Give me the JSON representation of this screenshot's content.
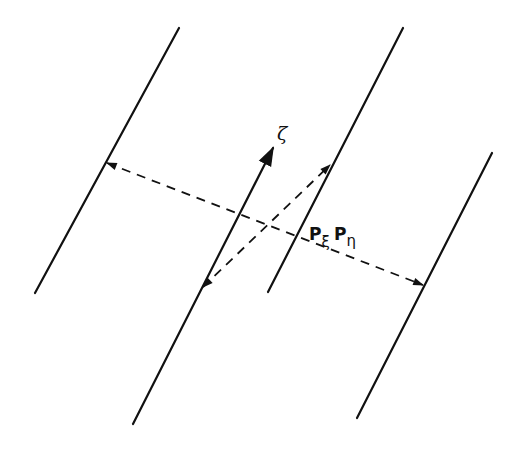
{
  "diagram": {
    "type": "geometric-projection-diagram",
    "background": "#ffffff",
    "stroke_color": "#111111",
    "parallel_lines": [
      {
        "id": "line-left",
        "x1": 179,
        "y1": 28,
        "x2": 35,
        "y2": 293
      },
      {
        "id": "line-middle",
        "x1": 403,
        "y1": 28,
        "x2": 268,
        "y2": 292
      },
      {
        "id": "line-right",
        "x1": 492,
        "y1": 153,
        "x2": 357,
        "y2": 418
      }
    ],
    "axis_arrow": {
      "id": "zeta-axis",
      "x1": 133,
      "y1": 424,
      "x2": 273,
      "y2": 148
    },
    "dashed_arrows": [
      {
        "id": "projection-long",
        "x1": 107,
        "y1": 163,
        "x2": 423,
        "y2": 285
      },
      {
        "id": "projection-short",
        "x1": 203,
        "y1": 287,
        "x2": 330,
        "y2": 165
      }
    ],
    "labels": {
      "zeta": "ζ",
      "p_xi_main": "P",
      "p_xi_sub": "ξ",
      "p_eta_main": "P",
      "p_eta_sub": "η"
    }
  }
}
